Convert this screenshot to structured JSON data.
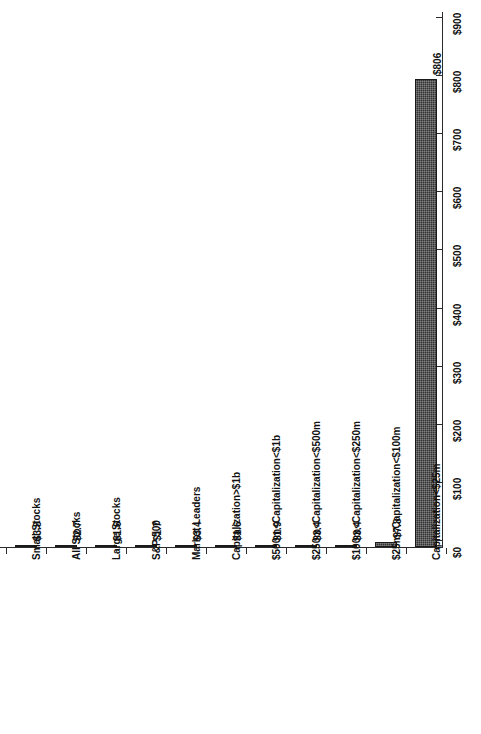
{
  "chart_data": {
    "type": "bar",
    "orientation": "horizontal-rotated",
    "title": "",
    "subtitle": "",
    "xlabel": "",
    "ylabel": "",
    "grid": false,
    "legend": null,
    "value_axis": {
      "min": 0,
      "max": 900,
      "tick_step": 100,
      "tick_labels": [
        "$0",
        "$100",
        "$200",
        "$300",
        "$400",
        "$500",
        "$600",
        "$700",
        "$800",
        "$900"
      ],
      "tick_values": [
        0,
        100,
        200,
        300,
        400,
        500,
        600,
        700,
        800,
        900
      ]
    },
    "categories": [
      "Small Stocks",
      "All Stocks",
      "Large Stocks",
      "S&P 500",
      "Market Leaders",
      "Capitalization>$1b",
      "$500m<Capitalization<$1b",
      "$250m<Capitalization<$500m",
      "$100m<Capitalization<$250m",
      "$25m<Capitalization<$100m",
      "Capitalization<$25m"
    ],
    "values": [
      3.8,
      2.7,
      1.6,
      1.7,
      3.4,
      1.6,
      1.9,
      3.4,
      3.4,
      7.8,
      806
    ],
    "data_labels": [
      "$3.8",
      "$2.7",
      "$1.6",
      "$1.7",
      "$3.4",
      "$1.6",
      "$1.9",
      "$3.4",
      "$3.4",
      "$7.8",
      "$806"
    ],
    "bar_color": "#333333"
  }
}
